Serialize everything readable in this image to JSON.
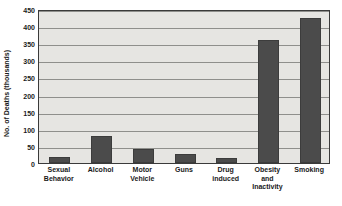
{
  "chart_data": {
    "type": "bar",
    "title": "",
    "subtitle": "",
    "xlabel": "",
    "ylabel": "No. of Deaths (thousands)",
    "ylim": [
      0,
      450
    ],
    "yticks": [
      0,
      50,
      100,
      150,
      200,
      250,
      300,
      350,
      400,
      450
    ],
    "ytick_labels": [
      "0",
      "50",
      "100",
      "150",
      "200",
      "250",
      "300",
      "350",
      "400",
      "450"
    ],
    "grid": true,
    "legend": false,
    "legend_position": "none",
    "categories": [
      "Sexual Behavior",
      "Alcohol",
      "Motor Vehicle",
      "Guns",
      "Drug induced",
      "Obesity and Inactivity",
      "Smoking"
    ],
    "category_label_lines": [
      [
        "Sexual",
        "Behavior"
      ],
      [
        "Alcohol"
      ],
      [
        "Motor",
        "Vehicle"
      ],
      [
        "Guns"
      ],
      [
        "Drug",
        "induced"
      ],
      [
        "Obesity",
        "and",
        "Inactivity"
      ],
      [
        "Smoking"
      ]
    ],
    "values": [
      18,
      78,
      40,
      27,
      15,
      358,
      425
    ],
    "bar_color": "#4b4b4b",
    "plot_background": "#e6e5e2",
    "gridline_color": "#8f8f8c",
    "axis_color": "#3a3a3a",
    "text_color": "#1a1a1a"
  }
}
